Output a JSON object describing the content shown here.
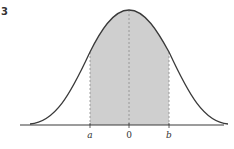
{
  "problem_number": "3",
  "labels": {
    "a": "a",
    "zero": "0",
    "b": "b"
  },
  "colors": {
    "curve": "#3a3a3a",
    "shade": "#cfcfcf",
    "axis": "#3a3a3a",
    "dashed": "#8a8a8a"
  }
}
